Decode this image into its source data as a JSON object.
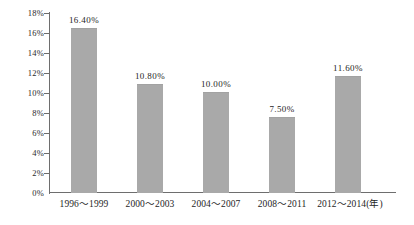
{
  "chart_data": {
    "type": "bar",
    "title": "",
    "subtitle": "",
    "xlabel": "年",
    "ylabel": "",
    "categories": [
      "1996～1999",
      "2000～2003",
      "2004～2007",
      "2008～2011",
      "2012～2014(年)"
    ],
    "values": [
      16.4,
      10.8,
      10.0,
      7.5,
      11.6
    ],
    "value_labels": [
      "16.40%",
      "10.80%",
      "10.00%",
      "7.50%",
      "11.60%"
    ],
    "ylim": [
      0,
      18
    ],
    "ytick_values": [
      0,
      2,
      4,
      6,
      8,
      10,
      12,
      14,
      16,
      18
    ],
    "ytick_labels": [
      "0%",
      "2%",
      "4%",
      "6%",
      "8%",
      "10%",
      "12%",
      "14%",
      "16%",
      "18%"
    ],
    "grid": false,
    "legend": null,
    "series": [
      {
        "name": "",
        "values": [
          16.4,
          10.8,
          10.0,
          7.5,
          11.6
        ],
        "color": "#a9a9a9"
      }
    ],
    "colors": {
      "bar": "#a9a9a9",
      "axis": "#6e6e6e",
      "text": "#1e1e1e",
      "background": "#ffffff"
    }
  }
}
